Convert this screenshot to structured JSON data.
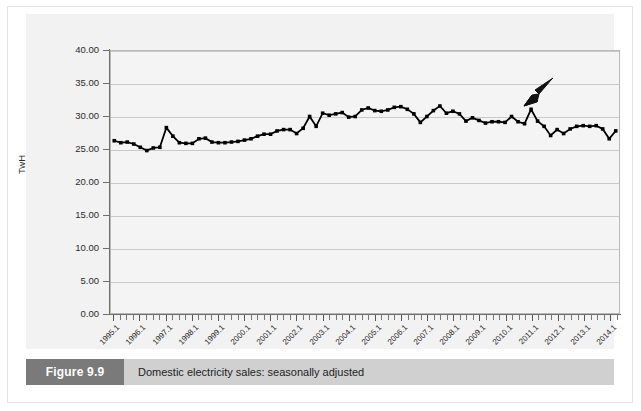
{
  "figure": {
    "caption_number": "Figure 9.9",
    "caption_text": "Domestic electricity sales: seasonally adjusted"
  },
  "chart_data": {
    "type": "line",
    "title": "",
    "subtitle": "",
    "xlabel": "Year and Quarter",
    "ylabel": "TwH",
    "ylim": [
      0,
      40
    ],
    "ytick_labels": [
      "0.00",
      "5.00",
      "10.00",
      "15.00",
      "20.00",
      "25.00",
      "30.00",
      "35.00",
      "40.00"
    ],
    "ytick_values": [
      0,
      5,
      10,
      15,
      20,
      25,
      30,
      35,
      40
    ],
    "grid": true,
    "legend": "none",
    "marker": "square",
    "line_color": "#000000",
    "marker_color": "#000000",
    "plot_background": "#f4f4f4",
    "panel_background": "#f2f2f2",
    "gridline_color": "#c9c9c9",
    "axis_color": "#6e6e6e",
    "xtick_labels": [
      "1995.1",
      "1996.1",
      "1997.1",
      "1998.1",
      "1999.1",
      "2000.1",
      "2001.1",
      "2002.1",
      "2003.1",
      "2004.1",
      "2005.1",
      "2006.1",
      "2007.1",
      "2008.1",
      "2009.1",
      "2010.1",
      "2011.1",
      "2012.1",
      "2013.1",
      "2014.1"
    ],
    "xtick_label_interval": 4,
    "x": [
      "1995.1",
      "1995.2",
      "1995.3",
      "1995.4",
      "1996.1",
      "1996.2",
      "1996.3",
      "1996.4",
      "1997.1",
      "1997.2",
      "1997.3",
      "1997.4",
      "1998.1",
      "1998.2",
      "1998.3",
      "1998.4",
      "1999.1",
      "1999.2",
      "1999.3",
      "1999.4",
      "2000.1",
      "2000.2",
      "2000.3",
      "2000.4",
      "2001.1",
      "2001.2",
      "2001.3",
      "2001.4",
      "2002.1",
      "2002.2",
      "2002.3",
      "2002.4",
      "2003.1",
      "2003.2",
      "2003.3",
      "2003.4",
      "2004.1",
      "2004.2",
      "2004.3",
      "2004.4",
      "2005.1",
      "2005.2",
      "2005.3",
      "2005.4",
      "2006.1",
      "2006.2",
      "2006.3",
      "2006.4",
      "2007.1",
      "2007.2",
      "2007.3",
      "2007.4",
      "2008.1",
      "2008.2",
      "2008.3",
      "2008.4",
      "2009.1",
      "2009.2",
      "2009.3",
      "2009.4",
      "2010.1",
      "2010.2",
      "2010.3",
      "2010.4",
      "2011.1",
      "2011.2",
      "2011.3",
      "2011.4",
      "2012.1",
      "2012.2",
      "2012.3",
      "2012.4",
      "2013.1",
      "2013.2",
      "2013.3",
      "2013.4",
      "2014.1",
      "2014.2"
    ],
    "values": [
      26.3,
      26.0,
      26.1,
      25.8,
      25.3,
      24.8,
      25.2,
      25.3,
      28.3,
      27.0,
      26.0,
      25.9,
      25.9,
      26.6,
      26.7,
      26.1,
      26.0,
      26.0,
      26.1,
      26.2,
      26.4,
      26.6,
      27.0,
      27.3,
      27.3,
      27.8,
      28.0,
      28.0,
      27.4,
      28.2,
      30.0,
      28.5,
      30.5,
      30.2,
      30.4,
      30.6,
      29.9,
      30.0,
      31.0,
      31.3,
      30.9,
      30.8,
      31.0,
      31.4,
      31.5,
      31.1,
      30.4,
      29.1,
      30.0,
      30.9,
      31.6,
      30.5,
      30.8,
      30.4,
      29.3,
      29.8,
      29.4,
      29.0,
      29.2,
      29.2,
      29.1,
      30.0,
      29.2,
      28.9,
      31.1,
      29.3,
      28.5,
      27.1,
      28.0,
      27.4,
      28.1,
      28.5,
      28.6,
      28.5,
      28.6,
      28.1,
      26.6,
      27.8
    ],
    "annotations": [
      {
        "type": "arrow",
        "points_to_x": "2011.1",
        "points_to_y": 31.1,
        "direction": "down-left"
      }
    ]
  }
}
